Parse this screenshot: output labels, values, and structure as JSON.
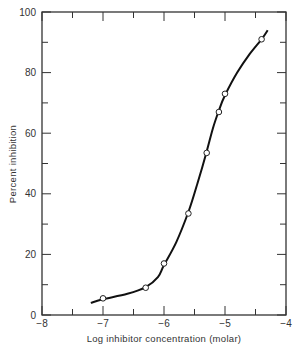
{
  "chart_data": {
    "type": "scatter",
    "title": "",
    "xlabel": "Log inhibitor concentration (molar)",
    "ylabel": "Percent inhibition",
    "xlim": [
      -8,
      -4
    ],
    "ylim": [
      0,
      100
    ],
    "x_ticks": [
      -8,
      -7,
      -6,
      -5,
      -4
    ],
    "x_tick_labels": [
      "−8",
      "−7",
      "−6",
      "−5",
      "−4"
    ],
    "x_minor_ticks": [
      -7.5,
      -6.5,
      -5.5,
      -4.5
    ],
    "y_ticks": [
      0,
      20,
      40,
      60,
      80,
      100
    ],
    "y_tick_labels": [
      "0",
      "20",
      "40",
      "60",
      "80",
      "100"
    ],
    "y_minor_ticks": [
      10,
      30,
      50,
      70,
      90
    ],
    "grid": false,
    "legend": null,
    "series": [
      {
        "name": "Observed",
        "marker": "open-circle",
        "x": [
          -7.0,
          -6.3,
          -6.0,
          -5.6,
          -5.3,
          -5.1,
          -5.0,
          -4.4
        ],
        "y": [
          5.5,
          9.0,
          17.0,
          33.5,
          53.5,
          67.0,
          73.0,
          91.0
        ]
      },
      {
        "name": "Fitted curve",
        "line": "smooth",
        "x": [
          -7.2,
          -7.0,
          -6.6,
          -6.3,
          -6.1,
          -6.0,
          -5.8,
          -5.6,
          -5.45,
          -5.3,
          -5.2,
          -5.1,
          -5.0,
          -4.8,
          -4.6,
          -4.4,
          -4.3
        ],
        "y": [
          4.0,
          5.2,
          7.0,
          9.2,
          12.5,
          16.5,
          24.0,
          34.0,
          43.5,
          54.0,
          61.5,
          67.5,
          72.5,
          80.0,
          86.0,
          91.0,
          94.0
        ]
      }
    ]
  },
  "colors": {
    "axis": "#333333",
    "curve": "#111111",
    "marker_fill": "#ffffff"
  }
}
